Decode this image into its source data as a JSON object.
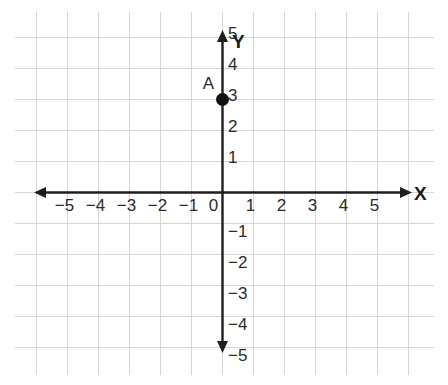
{
  "chart_data": {
    "type": "scatter",
    "title": "",
    "xlabel": "X",
    "ylabel": "Y",
    "xlim": [
      -6.5,
      6.5
    ],
    "ylim": [
      -6,
      6
    ],
    "grid": true,
    "grid_spacing": 1,
    "legend": "none",
    "x_ticks": [
      -5,
      -4,
      -3,
      -2,
      -1,
      0,
      1,
      2,
      3,
      4,
      5
    ],
    "x_tick_labels": [
      "−5",
      "−4",
      "−3",
      "−2",
      "−1",
      "0",
      "1",
      "2",
      "3",
      "4",
      "5"
    ],
    "y_ticks": [
      5,
      4,
      3,
      2,
      1,
      -1,
      -2,
      -3,
      -4,
      -5
    ],
    "y_tick_labels": [
      "5",
      "4",
      "3",
      "2",
      "1",
      "−1",
      "−2",
      "−3",
      "−4",
      "−5"
    ],
    "origin_label": "0",
    "points": [
      {
        "label": "A",
        "x": 0,
        "y": 3
      }
    ],
    "colors": {
      "grid": "#d6d6d6",
      "axis": "#1f1f1f",
      "point": "#111111",
      "text": "#2b2b2b",
      "background": "#ffffff"
    }
  },
  "axes": {
    "x_axis_name": "X",
    "y_axis_name": "Y"
  }
}
